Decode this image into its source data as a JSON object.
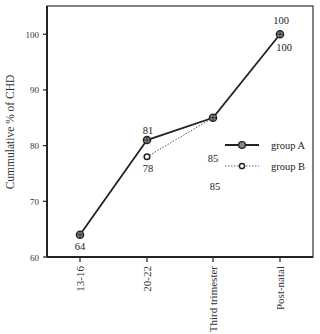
{
  "chart_data": {
    "type": "line",
    "title": "",
    "xlabel": "",
    "ylabel": "Cummulative % of CHD",
    "categories": [
      "13-16",
      "20-22",
      "Third trimester",
      "Post-natal"
    ],
    "series": [
      {
        "name": "group A",
        "style": "solid",
        "values": [
          64,
          81,
          85,
          100
        ],
        "labels": [
          "64",
          "81",
          "85",
          "100"
        ]
      },
      {
        "name": "group B",
        "style": "dotted",
        "values": [
          null,
          78,
          85,
          100
        ],
        "labels": [
          "",
          "78",
          "85",
          "100"
        ]
      }
    ],
    "ylim": [
      60,
      105
    ],
    "yticks": [
      60,
      70,
      80,
      90,
      100
    ],
    "ytick_labels": [
      "60",
      "70",
      "80",
      "90",
      "100"
    ],
    "grid": false,
    "legend_position": "right-middle inside plot"
  },
  "colors": {
    "line": "#222222",
    "axis": "#333333",
    "background": "#ffffff"
  }
}
